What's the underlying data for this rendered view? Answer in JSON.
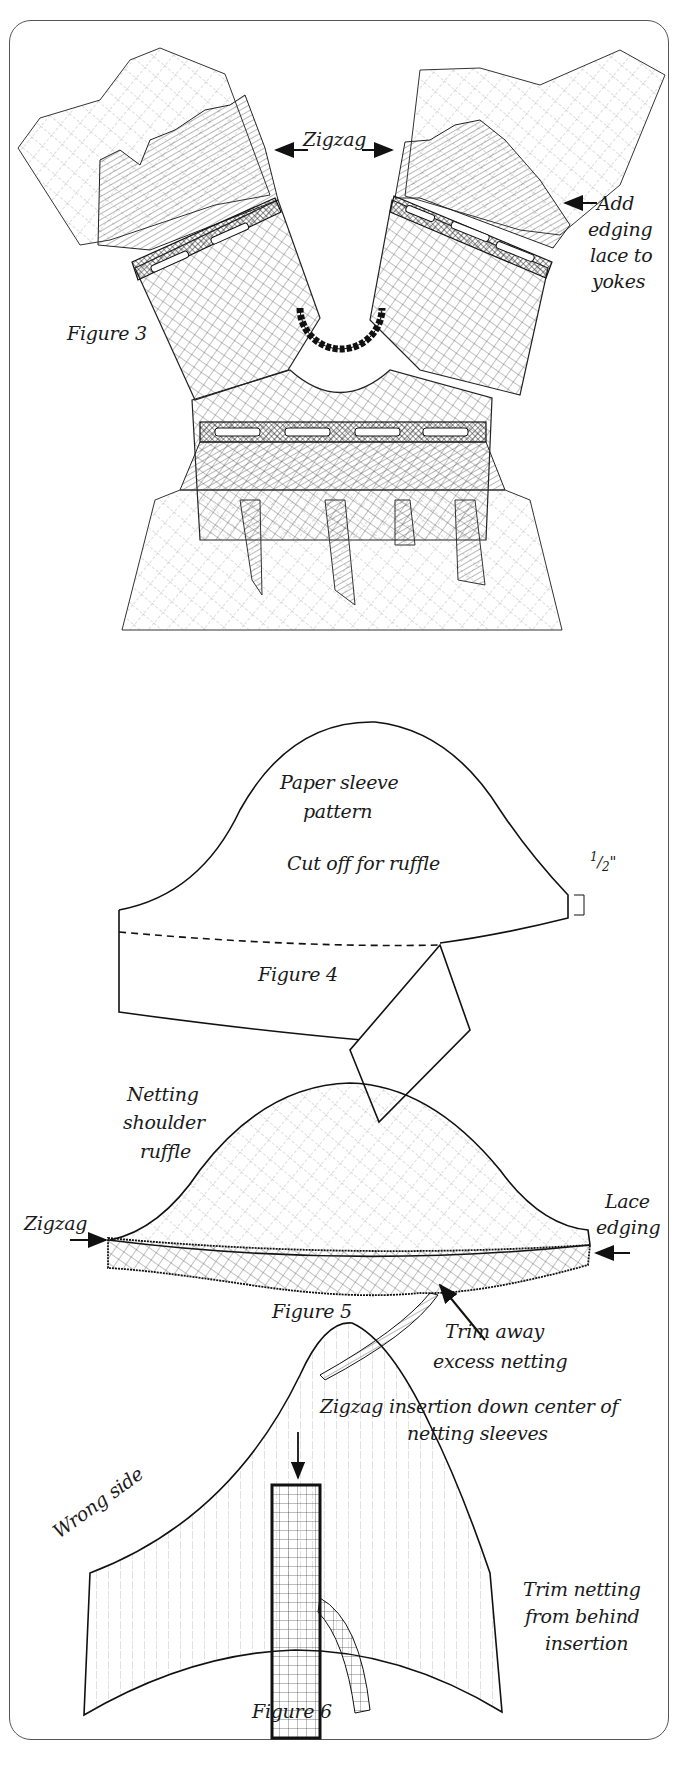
{
  "figures": [
    {
      "id": "figure-3",
      "caption": "Figure 3",
      "labels": {
        "zigzag": "Zigzag",
        "edging_1": "Add",
        "edging_2": "edging",
        "edging_3": "lace to",
        "edging_4": "yokes"
      }
    },
    {
      "id": "figure-4",
      "caption": "Figure 4",
      "labels": {
        "pattern_1": "Paper sleeve",
        "pattern_2": "pattern",
        "cut": "Cut off for ruffle",
        "measure_num": "1",
        "measure_den": "2",
        "measure_unit": "\""
      }
    },
    {
      "id": "figure-5",
      "caption": "Figure 5",
      "labels": {
        "ruffle_1": "Netting",
        "ruffle_2": "shoulder",
        "ruffle_3": "ruffle",
        "zigzag": "Zigzag",
        "lace_1": "Lace",
        "lace_2": "edging",
        "trim_1": "Trim away",
        "trim_2": "excess netting"
      }
    },
    {
      "id": "figure-6",
      "caption": "Figure 6",
      "labels": {
        "insert_1": "Zigzag insertion down center of",
        "insert_2": "netting sleeves",
        "wrong_side": "Wrong side",
        "trim_1": "Trim netting",
        "trim_2": "from behind",
        "trim_3": "insertion"
      }
    }
  ],
  "colors": {
    "ink": "#1a1a1a",
    "frame": "#555555",
    "paper": "#ffffff"
  }
}
